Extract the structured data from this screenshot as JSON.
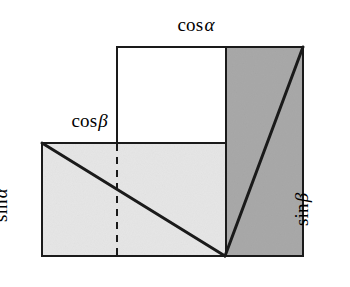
{
  "figure": {
    "canvas": {
      "width": 350,
      "height": 287,
      "background": "#ffffff"
    },
    "colors": {
      "stroke": "#1a1a1a",
      "light_gray_fill": "#e6e6e6",
      "dark_gray_fill": "#a9a9a9",
      "white_fill": "#ffffff",
      "dashed_stroke": "#1a1a1a"
    },
    "geometry": {
      "lower_rect": {
        "x": 42,
        "y": 143,
        "width": 261,
        "height": 113,
        "fill": "light_gray_fill",
        "name": "lower-left-rectangle"
      },
      "white_square": {
        "x": 117,
        "y": 47,
        "width": 109,
        "height": 96,
        "fill": "white_fill",
        "name": "upper-white-square"
      },
      "right_rect": {
        "x": 226,
        "y": 47,
        "width": 77,
        "height": 209,
        "fill": "dark_gray_fill",
        "name": "right-dark-rectangle"
      },
      "diagonal_left": {
        "x1": 42,
        "y1": 143,
        "x2": 225,
        "y2": 256,
        "name": "left-diagonal"
      },
      "diagonal_right": {
        "x1": 225,
        "y1": 256,
        "x2": 303,
        "y2": 47,
        "name": "right-diagonal"
      },
      "vertical_divider": {
        "x1": 226,
        "y1": 47,
        "x2": 226,
        "y2": 256,
        "name": "vertical-divider"
      },
      "dashed_line": {
        "x1": 117,
        "y1": 143,
        "x2": 117,
        "y2": 256,
        "name": "dashed-vertical-line"
      },
      "apex_point": {
        "x": 225,
        "y": 256,
        "name": "apex-vertex"
      }
    }
  },
  "labels": {
    "cos_alpha": {
      "fn": "cos",
      "var": "α",
      "full": "cosα",
      "position": "top",
      "rotation": 0
    },
    "cos_beta": {
      "fn": "cos",
      "var": "β",
      "full": "cosβ",
      "position": "upper-left",
      "rotation": 0
    },
    "sin_alpha": {
      "fn": "sin",
      "var": "α",
      "full": "sinα",
      "position": "left",
      "rotation": -90
    },
    "sin_beta": {
      "fn": "sin",
      "var": "β",
      "full": "sinβ",
      "position": "right",
      "rotation": -90
    }
  }
}
